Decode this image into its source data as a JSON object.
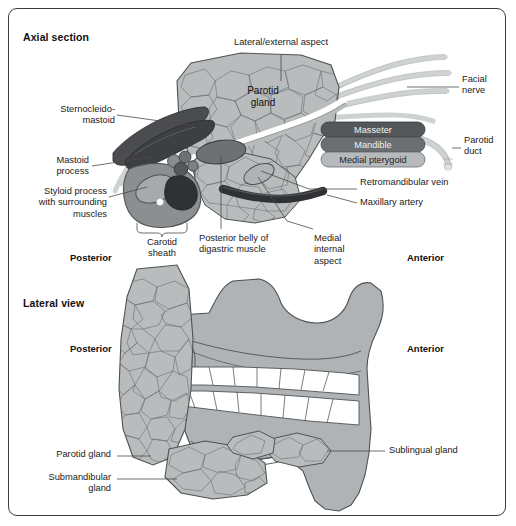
{
  "figure": {
    "background": "#ffffff",
    "frame_color": "#3b3b3b"
  },
  "palette": {
    "gland_fill": "#b9bcbd",
    "gland_stroke": "#4f5254",
    "bone_fill": "#b0b3b5",
    "muscle_dark": "#4a4c4f",
    "muscle_mid": "#6e7174",
    "vessel_light": "#cfd2d3",
    "vein_dark": "#3a3c3f",
    "box_dark": "#4f5254",
    "box_mid": "#6a6d70",
    "box_light": "#b9bcbd",
    "text": "#1a1a1a",
    "leader": "#4a4a4a"
  },
  "panels": [
    {
      "id": "axial",
      "title": "Axial section",
      "orientation": {
        "left": "Posterior",
        "right": "Anterior"
      },
      "inline_labels": [
        {
          "name": "parotid-gland-inline",
          "text": "Parotid\ngland"
        }
      ],
      "boxes": [
        {
          "name": "masseter-box",
          "label": "Masseter",
          "fill": "#54575a"
        },
        {
          "name": "mandible-box",
          "label": "Mandible",
          "fill": "#6c6f72"
        },
        {
          "name": "medial-pterygoid-box",
          "label": "Medial pterygoid",
          "fill": "#b7babc"
        }
      ],
      "labels": [
        {
          "name": "label-lateral-external-aspect",
          "text": "Lateral/external aspect"
        },
        {
          "name": "label-facial-nerve",
          "text": "Facial\nnerve"
        },
        {
          "name": "label-parotid-duct",
          "text": "Parotid\nduct"
        },
        {
          "name": "label-retromandibular-vein",
          "text": "Retromandibular vein"
        },
        {
          "name": "label-maxillary-artery",
          "text": "Maxillary artery"
        },
        {
          "name": "label-sternocleidomastoid",
          "text": "Sternocleido-\nmastoid"
        },
        {
          "name": "label-mastoid-process",
          "text": "Mastoid\nprocess"
        },
        {
          "name": "label-styloid-process",
          "text": "Styloid process\nwith surrounding\nmuscles"
        },
        {
          "name": "label-carotid-sheath",
          "text": "Carotid\nsheath"
        },
        {
          "name": "label-posterior-belly-digastric",
          "text": "Posterior belly of\ndigastric muscle"
        },
        {
          "name": "label-medial-internal-aspect",
          "text": "Medial\ninternal\naspect"
        }
      ]
    },
    {
      "id": "lateral",
      "title": "Lateral view",
      "orientation": {
        "left": "Posterior",
        "right": "Anterior"
      },
      "labels": [
        {
          "name": "label-parotid-gland",
          "text": "Parotid gland"
        },
        {
          "name": "label-submandibular-gland",
          "text": "Submandibular\ngland"
        },
        {
          "name": "label-sublingual-gland",
          "text": "Sublingual gland"
        }
      ]
    }
  ]
}
